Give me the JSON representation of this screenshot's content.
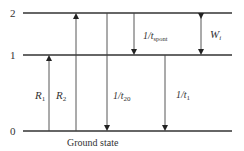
{
  "diagram": {
    "type": "energy-level-diagram",
    "levels": [
      {
        "label": "2",
        "y": 13
      },
      {
        "label": "1",
        "y": 55
      },
      {
        "label": "0",
        "y": 131
      }
    ],
    "ground_state_label": "Ground state",
    "transitions": [
      {
        "name": "R1",
        "main": "R",
        "sub": "1",
        "from": "0",
        "to": "1",
        "direction": "up"
      },
      {
        "name": "R2",
        "main": "R",
        "sub": "2",
        "from": "0",
        "to": "2",
        "direction": "up"
      },
      {
        "name": "1/t20",
        "main": "1/t",
        "sub": "20",
        "from": "2",
        "to": "0",
        "direction": "down"
      },
      {
        "name": "1/tspont",
        "main": "1/t",
        "sub": "spont",
        "from": "2",
        "to": "1",
        "direction": "down"
      },
      {
        "name": "1/t1",
        "main": "1/t",
        "sub": "1",
        "from": "1",
        "to": "0",
        "direction": "down"
      },
      {
        "name": "Wi",
        "main": "W",
        "sub": "i",
        "from": "1",
        "to": "2",
        "direction": "both"
      }
    ]
  }
}
